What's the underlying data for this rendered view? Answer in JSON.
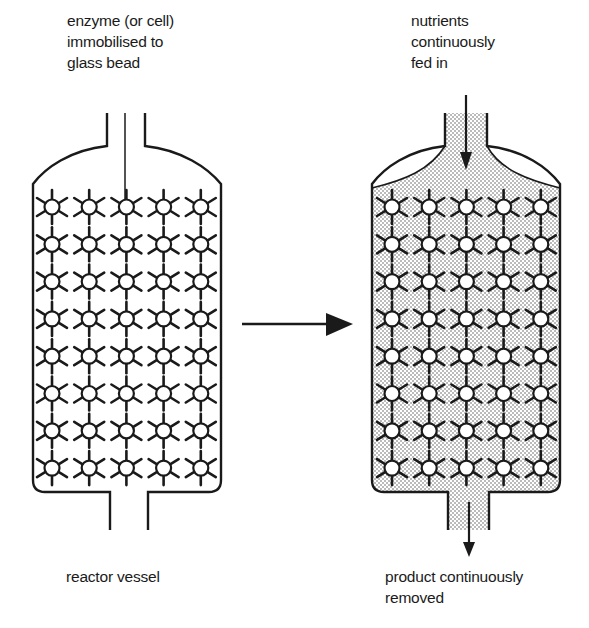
{
  "diagram": {
    "left_vessel": {
      "label_top_lines": [
        "enzyme (or cell)",
        "immobilised to",
        "glass bead"
      ],
      "label_bottom": "reactor vessel",
      "bead_grid": {
        "columns": 5,
        "rows": 8
      },
      "fill": "empty"
    },
    "process_arrow": {
      "direction": "right",
      "icon": "arrow-right-icon"
    },
    "right_vessel": {
      "label_top_lines": [
        "nutrients",
        "continuously",
        "fed in"
      ],
      "label_bottom_lines": [
        "product continuously",
        "removed"
      ],
      "bead_grid": {
        "columns": 5,
        "rows": 8
      },
      "fill": "stippled-medium",
      "inflow_arrow": {
        "direction": "down",
        "icon": "arrow-down-icon"
      },
      "outflow_arrow": {
        "direction": "down",
        "icon": "arrow-down-icon"
      }
    },
    "colors": {
      "line": "#1a1a1a",
      "background": "#ffffff",
      "stipple": "#555555"
    }
  }
}
